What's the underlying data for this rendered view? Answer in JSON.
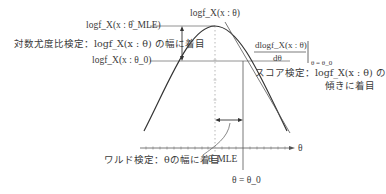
{
  "labels": {
    "loglik_mle": "logf_X(x : θ̂_MLE)",
    "loglik_ratio_test": "対数尤度比検定：logf_X(x : θ) の幅に着目",
    "loglik_theta0": "logf_X(x : θ_0)",
    "curve_title": "logf_X(x : θ)",
    "derivative_numerator": "dlogf_X(x : θ)",
    "derivative_denominator": "dθ",
    "derivative_eval": "θ = θ_0",
    "score_test_line1": "スコア検定：logf_X(x : θ) の",
    "score_test_line2": "傾きに着目",
    "wald_test": "ワルド検定：θの幅に着目",
    "theta_mle": "θ̂_MLE",
    "theta_axis": "θ",
    "theta_eq_theta0": "θ = θ_0"
  },
  "colors": {
    "line": "#333333",
    "guide": "#888888",
    "text": "#3a3a3a"
  }
}
